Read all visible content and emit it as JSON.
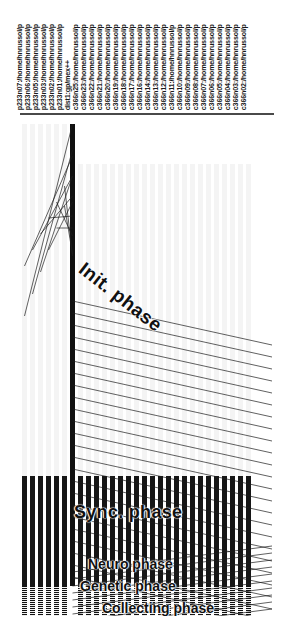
{
  "view": {
    "title": "Parallel trace timeline",
    "background": "#ffffff",
    "line_color": "#2b2b2b",
    "busy_color": "#161616",
    "idle_color": "#f4f4f4"
  },
  "processes": [
    {
      "label": "p233n07:/home/hnrussol/p",
      "x": 22
    },
    {
      "label": "p233n06:/home/hnrussol/p",
      "x": 30
    },
    {
      "label": "p233n05:/home/hnrussol/p",
      "x": 38
    },
    {
      "label": "p233n03:/home/hnrussol/p",
      "x": 46
    },
    {
      "label": "p233n02:/home/hnrussol/p",
      "x": 54
    },
    {
      "label": "p233n01:/home/hnrussol/p",
      "x": 62
    },
    {
      "label": "dist1:gp/mex++",
      "x": 70
    },
    {
      "label": "c366n25:/home/hnrussol/p",
      "x": 78
    },
    {
      "label": "c366n23:/home/hnrussol/p",
      "x": 86
    },
    {
      "label": "c366n22:/home/hnrussol/p",
      "x": 94
    },
    {
      "label": "c366n21:/home/hnrussol/p",
      "x": 102
    },
    {
      "label": "c366n20:/home/hnrussol/p",
      "x": 110
    },
    {
      "label": "c366n19:/home/hnrussol/p",
      "x": 118
    },
    {
      "label": "c366n18:/home/hnrussol/p",
      "x": 126
    },
    {
      "label": "c366n17:/home/hnrussol/p",
      "x": 134
    },
    {
      "label": "c366n16:/home/hnrussol/p",
      "x": 142
    },
    {
      "label": "c366n14:/home/hnrussol/p",
      "x": 150
    },
    {
      "label": "c366n13:/home/hnrussol/p",
      "x": 158
    },
    {
      "label": "c366n12:/home/hnrussol/p",
      "x": 166
    },
    {
      "label": "c366n11:/home/hnrussol/p",
      "x": 174
    },
    {
      "label": "c366n10:/home/hnrussol/p",
      "x": 182
    },
    {
      "label": "c366n09:/home/hnrussol/p",
      "x": 190
    },
    {
      "label": "c366n08:/home/hnrussol/p",
      "x": 198
    },
    {
      "label": "c366n07:/home/hnrussol/p",
      "x": 206
    },
    {
      "label": "c366n06:/home/hnrussol/p",
      "x": 214
    },
    {
      "label": "c366n05:/home/hnrussol/p",
      "x": 222
    },
    {
      "label": "c366n04:/home/hnrussol/p",
      "x": 230
    },
    {
      "label": "c366n03:/home/hnrussol/p",
      "x": 238
    },
    {
      "label": "c366n02:/home/hnrussol/p",
      "x": 246
    }
  ],
  "phases": [
    {
      "id": "init",
      "label": "Init. phase"
    },
    {
      "id": "sync",
      "label": "Sync. phase"
    },
    {
      "id": "neuro",
      "label": "Neuro phase"
    },
    {
      "id": "genetic",
      "label": "Genetic phase"
    },
    {
      "id": "collect",
      "label": "Collecting phase"
    }
  ],
  "chart_data": {
    "type": "timeline",
    "xlabel": "",
    "ylabel": "",
    "grid": false,
    "legend_position": "none",
    "axis_ranges": {
      "time_top": 0,
      "time_bottom": 500
    },
    "annotations": [
      {
        "text": "Init. phase",
        "x": 88,
        "y": 258,
        "rotation": 38
      },
      {
        "text": "Sync. phase",
        "x": 74,
        "y": 502,
        "rotation": 0
      },
      {
        "text": "Neuro phase",
        "x": 88,
        "y": 556,
        "rotation": 0
      },
      {
        "text": "Genetic phase",
        "x": 80,
        "y": 578,
        "rotation": 0
      },
      {
        "text": "Collecting phase",
        "x": 102,
        "y": 600,
        "rotation": 0
      }
    ],
    "categories": [
      "p233n07",
      "p233n06",
      "p233n05",
      "p233n03",
      "p233n02",
      "p233n01",
      "dist1",
      "c366n25",
      "c366n23",
      "c366n22",
      "c366n21",
      "c366n20",
      "c366n19",
      "c366n18",
      "c366n17",
      "c366n16",
      "c366n14",
      "c366n13",
      "c366n12",
      "c366n11",
      "c366n10",
      "c366n09",
      "c366n08",
      "c366n07",
      "c366n06",
      "c366n05",
      "c366n04",
      "c366n03",
      "c366n02"
    ],
    "series": [
      {
        "name": "start_time",
        "values": [
          8,
          8,
          8,
          8,
          8,
          8,
          8,
          48,
          48,
          48,
          48,
          48,
          48,
          48,
          48,
          48,
          48,
          48,
          48,
          48,
          48,
          48,
          48,
          48,
          48,
          48,
          48,
          48,
          48
        ]
      },
      {
        "name": "end_time",
        "values": [
          500,
          500,
          500,
          500,
          500,
          500,
          470,
          500,
          500,
          500,
          500,
          500,
          500,
          500,
          500,
          500,
          500,
          500,
          500,
          500,
          500,
          500,
          500,
          500,
          500,
          500,
          500,
          500,
          500
        ]
      },
      {
        "name": "busy_start",
        "values": [
          360,
          360,
          360,
          360,
          360,
          360,
          0,
          360,
          360,
          360,
          360,
          360,
          360,
          360,
          360,
          360,
          360,
          360,
          360,
          360,
          360,
          360,
          360,
          360,
          360,
          360,
          360,
          360,
          360
        ]
      }
    ]
  }
}
